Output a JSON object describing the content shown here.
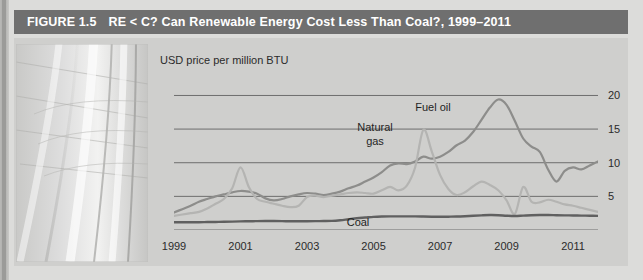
{
  "figure": {
    "number_label": "FIGURE 1.5",
    "title": "RE < C? Can Renewable Energy Cost Less Than Coal?, 1999–2011",
    "title_bar_color": "#6f6f6f",
    "panel_color": "#cfcfcd"
  },
  "photo": {
    "alt_name": "architectural-curves-photo",
    "description": "grayscale photo of curved architectural vault with grid lines"
  },
  "chart_data": {
    "type": "line",
    "title": "RE < C? Can Renewable Energy Cost Less Than Coal?, 1999–2011",
    "subtitle": "",
    "xlabel": "",
    "ylabel": "USD price per million BTU",
    "grid": true,
    "legend_position": "inline-annotations",
    "xlim": [
      1999,
      2011.75
    ],
    "ylim": [
      0,
      22
    ],
    "yticks": [
      5,
      10,
      15,
      20
    ],
    "xticks": [
      1999,
      2001,
      2003,
      2005,
      2007,
      2009,
      2011
    ],
    "xtick_labels": [
      "1999",
      "2001",
      "2003",
      "2005",
      "2007",
      "2009",
      "2011"
    ],
    "ytick_labels": [
      "5",
      "10",
      "15",
      "20"
    ],
    "series": [
      {
        "name": "Fuel oil",
        "color": "#8d8d8b",
        "width": 2.2,
        "x": [
          1999.0,
          1999.25,
          1999.5,
          1999.75,
          2000.0,
          2000.25,
          2000.5,
          2000.75,
          2001.0,
          2001.25,
          2001.5,
          2001.75,
          2002.0,
          2002.25,
          2002.5,
          2002.75,
          2003.0,
          2003.25,
          2003.5,
          2003.75,
          2004.0,
          2004.25,
          2004.5,
          2004.75,
          2005.0,
          2005.25,
          2005.5,
          2005.75,
          2006.0,
          2006.25,
          2006.5,
          2006.75,
          2007.0,
          2007.25,
          2007.5,
          2007.75,
          2008.0,
          2008.25,
          2008.5,
          2008.75,
          2009.0,
          2009.25,
          2009.5,
          2009.75,
          2010.0,
          2010.25,
          2010.5,
          2010.75,
          2011.0,
          2011.25,
          2011.5,
          2011.75
        ],
        "y": [
          2.6,
          3.1,
          3.6,
          4.2,
          4.6,
          5.0,
          5.3,
          5.6,
          5.8,
          5.7,
          5.4,
          4.7,
          4.4,
          4.6,
          5.0,
          5.3,
          5.5,
          5.4,
          5.2,
          5.4,
          5.7,
          6.2,
          6.6,
          7.2,
          7.8,
          8.6,
          9.6,
          9.9,
          9.8,
          10.2,
          10.9,
          10.6,
          10.9,
          11.6,
          12.6,
          13.3,
          14.6,
          16.4,
          18.2,
          19.4,
          18.6,
          16.2,
          13.6,
          12.4,
          11.6,
          9.0,
          7.2,
          8.8,
          9.3,
          9.0,
          9.6,
          10.2
        ]
      },
      {
        "name": "Natural gas",
        "color": "#b4b4b2",
        "width": 2.2,
        "x": [
          1999.0,
          1999.25,
          1999.5,
          1999.75,
          2000.0,
          2000.25,
          2000.5,
          2000.75,
          2001.0,
          2001.25,
          2001.5,
          2001.75,
          2002.0,
          2002.25,
          2002.5,
          2002.75,
          2003.0,
          2003.25,
          2003.5,
          2003.75,
          2004.0,
          2004.25,
          2004.5,
          2004.75,
          2005.0,
          2005.25,
          2005.5,
          2005.75,
          2006.0,
          2006.25,
          2006.5,
          2006.75,
          2007.0,
          2007.25,
          2007.5,
          2007.75,
          2008.0,
          2008.25,
          2008.5,
          2008.75,
          2009.0,
          2009.25,
          2009.5,
          2009.75,
          2010.0,
          2010.25,
          2010.5,
          2010.75,
          2011.0,
          2011.25,
          2011.5,
          2011.75
        ],
        "y": [
          2.1,
          2.3,
          2.5,
          2.7,
          3.2,
          3.9,
          4.6,
          6.2,
          9.3,
          6.4,
          4.6,
          4.2,
          3.9,
          3.6,
          3.4,
          3.6,
          4.9,
          5.1,
          4.9,
          5.1,
          5.3,
          5.5,
          5.6,
          5.5,
          5.4,
          5.9,
          6.4,
          5.9,
          6.6,
          9.3,
          14.9,
          11.7,
          8.2,
          6.1,
          5.2,
          5.6,
          6.5,
          7.2,
          6.7,
          5.9,
          4.4,
          2.4,
          6.4,
          4.2,
          4.1,
          4.5,
          4.2,
          3.8,
          3.6,
          3.3,
          3.0,
          2.7
        ]
      },
      {
        "name": "Coal",
        "color": "#606060",
        "width": 2.4,
        "x": [
          1999.0,
          1999.25,
          1999.5,
          1999.75,
          2000.0,
          2000.25,
          2000.5,
          2000.75,
          2001.0,
          2001.25,
          2001.5,
          2001.75,
          2002.0,
          2002.25,
          2002.5,
          2002.75,
          2003.0,
          2003.25,
          2003.5,
          2003.75,
          2004.0,
          2004.25,
          2004.5,
          2004.75,
          2005.0,
          2005.25,
          2005.5,
          2005.75,
          2006.0,
          2006.25,
          2006.5,
          2006.75,
          2007.0,
          2007.25,
          2007.5,
          2007.75,
          2008.0,
          2008.25,
          2008.5,
          2008.75,
          2009.0,
          2009.25,
          2009.5,
          2009.75,
          2010.0,
          2010.25,
          2010.5,
          2010.75,
          2011.0,
          2011.25,
          2011.5,
          2011.75
        ],
        "y": [
          1.15,
          1.15,
          1.15,
          1.15,
          1.18,
          1.2,
          1.22,
          1.25,
          1.28,
          1.3,
          1.32,
          1.33,
          1.33,
          1.32,
          1.3,
          1.3,
          1.31,
          1.32,
          1.33,
          1.35,
          1.45,
          1.6,
          1.75,
          1.85,
          1.95,
          2.0,
          2.02,
          2.03,
          2.03,
          2.02,
          2.0,
          1.98,
          1.96,
          1.98,
          2.0,
          2.05,
          2.12,
          2.18,
          2.22,
          2.2,
          2.12,
          2.08,
          2.14,
          2.2,
          2.22,
          2.22,
          2.2,
          2.18,
          2.16,
          2.14,
          2.12,
          2.1
        ]
      }
    ],
    "annotations": [
      {
        "name": "natural-gas-label",
        "text_line1": "Natural",
        "text_line2": "gas",
        "x_px": 222,
        "y_px": 83
      },
      {
        "name": "fuel-oil-label",
        "text": "Fuel oil",
        "x_px": 430,
        "y_px": 62
      },
      {
        "name": "coal-label",
        "text": "Coal",
        "x_px": 360,
        "y_px": 176
      }
    ]
  }
}
